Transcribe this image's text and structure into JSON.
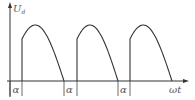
{
  "diagram": {
    "type": "waveform",
    "y_axis_label": "U",
    "y_axis_subscript": "d",
    "x_axis_label": "ωt",
    "angle_label": "α",
    "pulse_count": 3,
    "colors": {
      "line": "#333333",
      "label": "#555555"
    }
  }
}
